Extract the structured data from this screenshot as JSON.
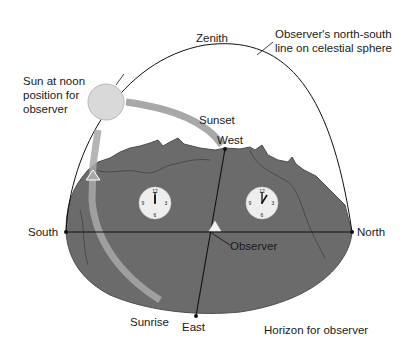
{
  "labels": {
    "zenith": "Zenith",
    "ns_line_1": "Observer's north-south",
    "ns_line_2": "line on celestial sphere",
    "sun_noon_1": "Sun at noon",
    "sun_noon_2": "position for",
    "sun_noon_3": "observer",
    "sunset": "Sunset",
    "west": "West",
    "south": "South",
    "north": "North",
    "observer": "Observer",
    "sunrise": "Sunrise",
    "east": "East",
    "horizon": "Horizon for observer"
  },
  "clocks": [
    {
      "name": "noon-clock",
      "numbers": [
        "12",
        "3",
        "6",
        "9"
      ],
      "time": "12:00"
    },
    {
      "name": "one-oclock-clock",
      "numbers": [
        "12",
        "3",
        "6",
        "9"
      ],
      "time": "1:00"
    }
  ],
  "colors": {
    "earth": "#6b6b6b",
    "earth_dark": "#4e4e4e",
    "sun": "#d9d9d9",
    "sun_path": "#a8a8a8",
    "line": "#111111",
    "clock_face": "#eeeeee"
  }
}
